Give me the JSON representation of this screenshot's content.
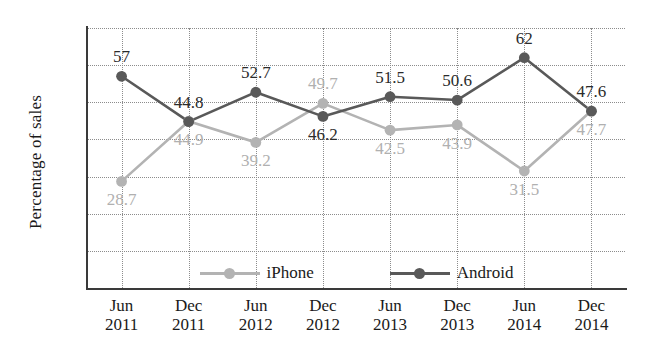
{
  "chart_data": {
    "type": "line",
    "title": "",
    "xlabel": "",
    "ylabel": "Percentage of sales",
    "categories": [
      "Jun 2011",
      "Dec 2011",
      "Jun 2012",
      "Dec 2012",
      "Jun 2013",
      "Dec 2013",
      "Jun 2014",
      "Dec 2014"
    ],
    "x_tick_months": [
      "Jun",
      "Dec",
      "Jun",
      "Dec",
      "Jun",
      "Dec",
      "Jun",
      "Dec"
    ],
    "x_tick_years": [
      "2011",
      "2011",
      "2012",
      "2012",
      "2013",
      "2013",
      "2014",
      "2014"
    ],
    "ylim": [
      0,
      70
    ],
    "y_ticks": [
      70,
      60,
      50,
      40,
      30,
      20,
      10,
      0
    ],
    "grid": true,
    "legend_position": "bottom-inside",
    "series": [
      {
        "name": "iPhone",
        "color": "#b3b3b3",
        "values": [
          28.7,
          44.9,
          39.2,
          49.7,
          42.5,
          43.9,
          31.5,
          47.7
        ],
        "labels": [
          "28.7",
          "44.9",
          "39.2",
          "49.7",
          "42.5",
          "43.9",
          "31.5",
          "47.7"
        ],
        "label_side": [
          "below",
          "below",
          "below",
          "above",
          "below",
          "below",
          "below",
          "below"
        ]
      },
      {
        "name": "Android",
        "color": "#595959",
        "values": [
          57,
          44.8,
          52.7,
          46.2,
          51.5,
          50.6,
          62,
          47.6
        ],
        "labels": [
          "57",
          "44.8",
          "52.7",
          "46.2",
          "51.5",
          "50.6",
          "62",
          "47.6"
        ],
        "label_side": [
          "above",
          "above",
          "above",
          "below",
          "above",
          "above",
          "above",
          "above"
        ]
      }
    ]
  },
  "legend": {
    "items": [
      {
        "label": "iPhone"
      },
      {
        "label": "Android"
      }
    ]
  }
}
